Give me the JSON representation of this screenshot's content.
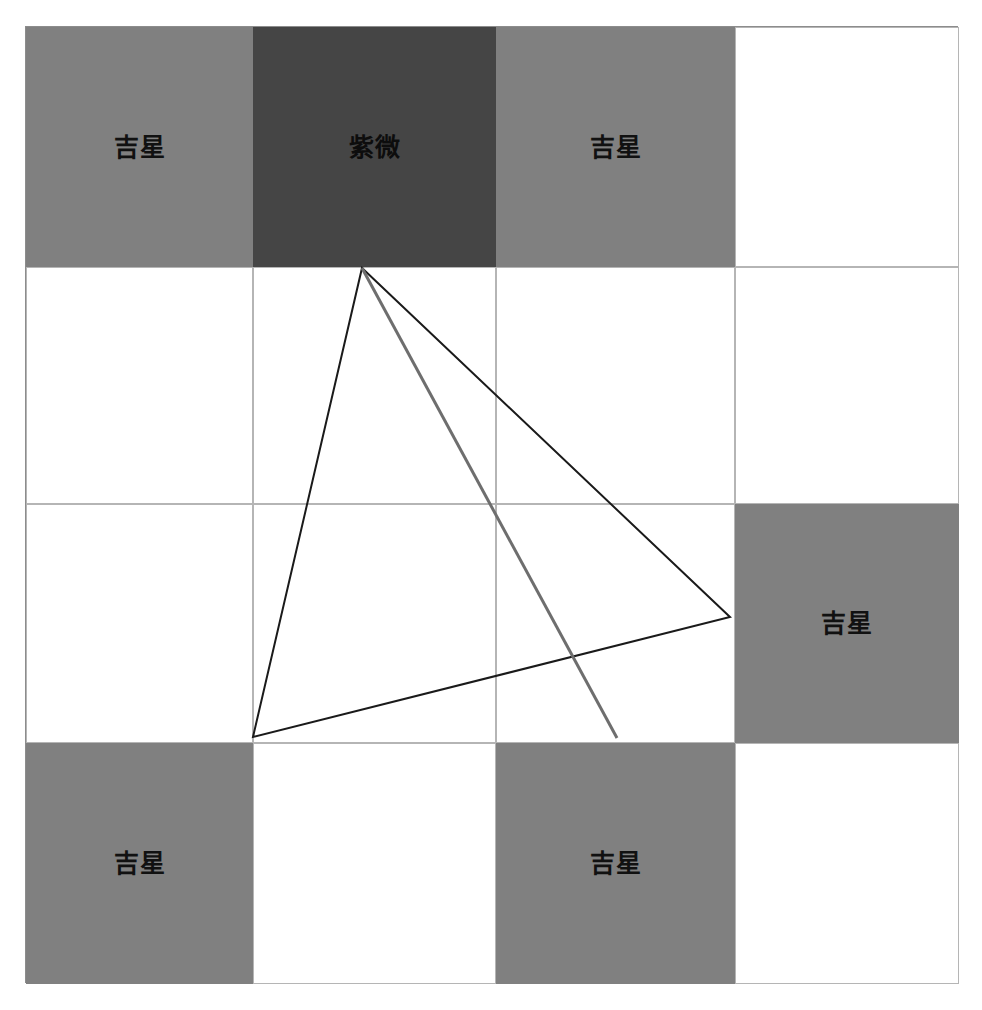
{
  "canvas": {
    "width": 982,
    "height": 1010,
    "background": "#ffffff"
  },
  "chart": {
    "title": "",
    "frame": {
      "x": 25,
      "y": 26,
      "width": 933,
      "height": 957,
      "border_color": "#8c8c8c"
    },
    "grid": {
      "columns": 4,
      "rows": 4,
      "column_edges": [
        25,
        252,
        495,
        734,
        958
      ],
      "row_edges": [
        26,
        266,
        503,
        742,
        983
      ],
      "cell_border_color": "#b5b5b5"
    },
    "palette": {
      "empty": "#ffffff",
      "auspicious_star": "#808080",
      "emperor_star": "#454545",
      "frame_line": "#8c8c8c",
      "grid_line": "#b5b5b5",
      "triangle_line": "#1a1a1a",
      "ray_line": "#6e6e6e",
      "label_text": "#111111"
    },
    "cells": [
      {
        "row": 1,
        "col": 1,
        "label": "吉星",
        "fill": "auspicious_star",
        "type": "star"
      },
      {
        "row": 1,
        "col": 2,
        "label": "紫微",
        "fill": "emperor_star",
        "type": "star"
      },
      {
        "row": 1,
        "col": 3,
        "label": "吉星",
        "fill": "auspicious_star",
        "type": "star"
      },
      {
        "row": 1,
        "col": 4,
        "label": "",
        "fill": "empty",
        "type": "empty"
      },
      {
        "row": 2,
        "col": 1,
        "label": "",
        "fill": "empty",
        "type": "empty"
      },
      {
        "row": 2,
        "col": 2,
        "label": "",
        "fill": "empty",
        "type": "empty"
      },
      {
        "row": 2,
        "col": 3,
        "label": "",
        "fill": "empty",
        "type": "empty"
      },
      {
        "row": 2,
        "col": 4,
        "label": "",
        "fill": "empty",
        "type": "empty"
      },
      {
        "row": 3,
        "col": 1,
        "label": "",
        "fill": "empty",
        "type": "empty"
      },
      {
        "row": 3,
        "col": 2,
        "label": "",
        "fill": "empty",
        "type": "empty"
      },
      {
        "row": 3,
        "col": 3,
        "label": "",
        "fill": "empty",
        "type": "empty"
      },
      {
        "row": 3,
        "col": 4,
        "label": "吉星",
        "fill": "auspicious_star",
        "type": "star"
      },
      {
        "row": 4,
        "col": 1,
        "label": "吉星",
        "fill": "auspicious_star",
        "type": "star"
      },
      {
        "row": 4,
        "col": 2,
        "label": "",
        "fill": "empty",
        "type": "empty"
      },
      {
        "row": 4,
        "col": 3,
        "label": "吉星",
        "fill": "auspicious_star",
        "type": "star"
      },
      {
        "row": 4,
        "col": 4,
        "label": "",
        "fill": "empty",
        "type": "empty"
      }
    ],
    "overlay": {
      "triangle": {
        "name": "san-fang-si-zheng-triangle",
        "points": "362,268 730,617 253,737",
        "stroke": "#1a1a1a",
        "stroke_width": 2,
        "fill": "none"
      },
      "ray": {
        "name": "opposition-ray",
        "x1": 362,
        "y1": 268,
        "x2": 617,
        "y2": 738,
        "stroke": "#6e6e6e",
        "stroke_width": 3
      }
    }
  },
  "chart_data": {
    "type": "heatmap",
    "title": "",
    "xlabel": "",
    "ylabel": "",
    "categories": [
      "col-1",
      "col-2",
      "col-3",
      "col-4"
    ],
    "rows": [
      "row-1",
      "row-2",
      "row-3",
      "row-4"
    ],
    "legend": [
      {
        "label": "吉星",
        "color": "#808080"
      },
      {
        "label": "紫微",
        "color": "#454545"
      },
      {
        "label": "",
        "color": "#ffffff"
      }
    ],
    "values": [
      [
        1,
        2,
        1,
        0
      ],
      [
        0,
        0,
        0,
        0
      ],
      [
        0,
        0,
        0,
        1
      ],
      [
        1,
        0,
        1,
        0
      ]
    ],
    "value_labels": [
      [
        "吉星",
        "紫微",
        "吉星",
        ""
      ],
      [
        "",
        "",
        "",
        ""
      ],
      [
        "",
        "",
        "",
        "吉星"
      ],
      [
        "吉星",
        "",
        "吉星",
        ""
      ]
    ],
    "annotations": [
      {
        "type": "triangle",
        "points": [
          [
            362,
            268
          ],
          [
            730,
            617
          ],
          [
            253,
            737
          ]
        ],
        "color": "#1a1a1a"
      },
      {
        "type": "line",
        "points": [
          [
            362,
            268
          ],
          [
            617,
            738
          ]
        ],
        "color": "#6e6e6e"
      }
    ],
    "grid": true,
    "legend_position": "none"
  }
}
